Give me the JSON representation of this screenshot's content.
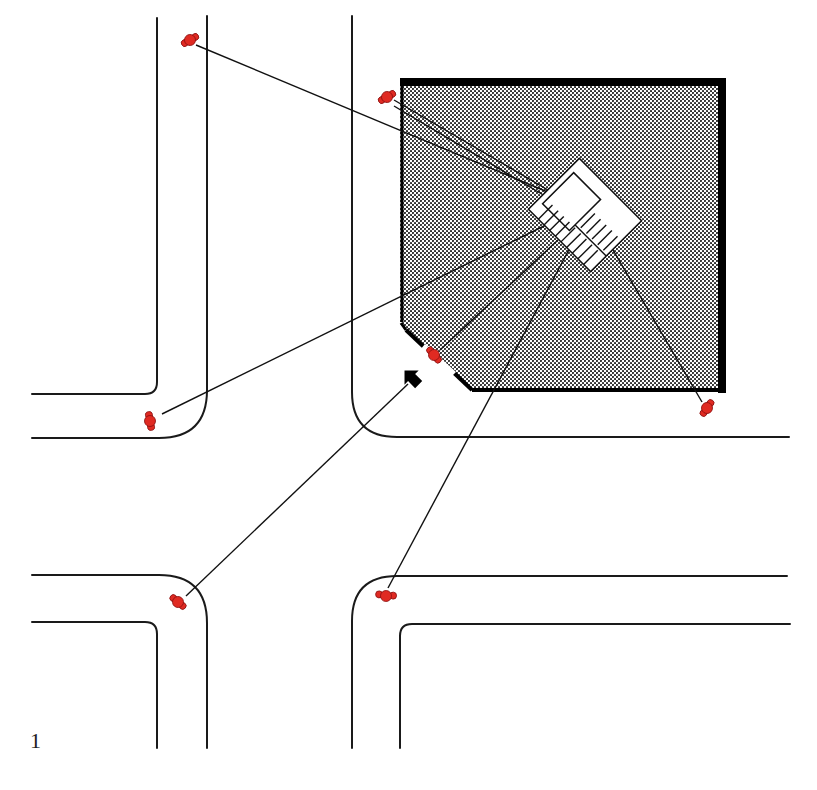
{
  "figure": {
    "label": "1"
  },
  "colors": {
    "road_line": "#1a1a1a",
    "building_fill_dot": "#222222",
    "building_border": "#000000",
    "person": "#e02a22",
    "person_outline": "#8a1010",
    "sight_line": "#111111"
  },
  "building": {
    "name": "corner building",
    "outline": [
      [
        400,
        80
      ],
      [
        724,
        80
      ],
      [
        724,
        391
      ],
      [
        472,
        391
      ],
      [
        400,
        324
      ]
    ],
    "entrance_gap": {
      "from": [
        435,
        358
      ],
      "to": [
        452,
        374
      ]
    }
  },
  "focal_feature": {
    "name": "stair",
    "center": [
      585,
      215
    ]
  },
  "entrance_arrow": {
    "x": 413,
    "y": 378,
    "direction": "up-right"
  },
  "people": [
    {
      "id": "p1",
      "x": 190,
      "y": 40,
      "target": [
        548,
        190
      ]
    },
    {
      "id": "p2",
      "x": 387,
      "y": 97,
      "target": [
        550,
        195
      ]
    },
    {
      "id": "p3",
      "x": 150,
      "y": 420,
      "target": [
        548,
        223
      ]
    },
    {
      "id": "p4",
      "x": 433,
      "y": 355,
      "target": [
        566,
        235
      ]
    },
    {
      "id": "p5",
      "x": 706,
      "y": 407,
      "target": [
        607,
        238
      ]
    },
    {
      "id": "p6",
      "x": 178,
      "y": 602,
      "target": [
        412,
        382
      ]
    },
    {
      "id": "p7",
      "x": 386,
      "y": 595,
      "target": [
        572,
        242
      ]
    }
  ]
}
